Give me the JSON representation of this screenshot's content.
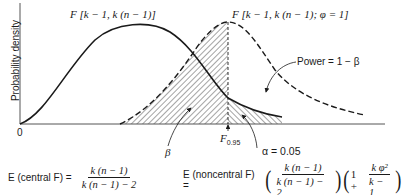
{
  "figure": {
    "y_axis_label": "Probability density",
    "origin_label": "0",
    "central_curve_label": "F [k − 1, k (n − 1)]",
    "noncentral_curve_label": "F [k − 1, k (n − 1); φ = 1]",
    "critical_value_label": "F",
    "critical_value_subscript": "0.95",
    "power_label": "Power = 1 − β",
    "beta_label": "β",
    "alpha_label": "α = 0.05",
    "colors": {
      "ink": "#1a1a1a",
      "axis": "#555555",
      "background": "#ffffff"
    }
  },
  "formulas": {
    "central": {
      "lhs": "E (central F) =",
      "numerator": "k (n − 1)",
      "denominator": "k (n − 1) − 2"
    },
    "noncentral": {
      "lhs": "E (noncentral F) =",
      "numerator": "k (n − 1)",
      "denominator": "k (n − 1) − 2",
      "factor_prefix": "1 +",
      "factor_numerator": "k φ²",
      "factor_denominator": "k − 1"
    }
  }
}
